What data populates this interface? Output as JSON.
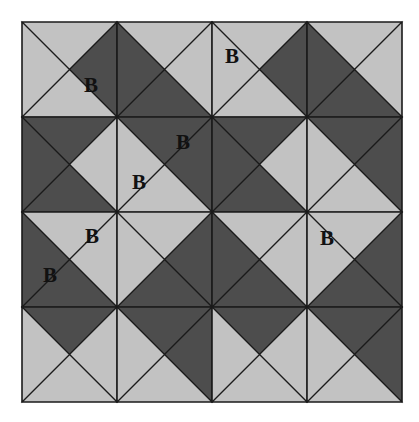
{
  "figure": {
    "background_color": "#ffffff"
  },
  "palette": {
    "light": "#c2c2c2",
    "dark": "#4d4d4d",
    "outline": "#1a1a1a",
    "label_color": "#111111"
  },
  "geometry": {
    "origin_x": 22,
    "origin_y": 22,
    "cell_size": 95,
    "columns": 4,
    "rows": 4,
    "column_edges": [
      22,
      117,
      212,
      307,
      402
    ],
    "row_edges": [
      22,
      117,
      212,
      307,
      402
    ]
  },
  "chart_data": {
    "type": "heatmap",
    "xlabel": "",
    "ylabel": "",
    "categories": [
      "col-1",
      "col-2",
      "col-3",
      "col-4"
    ],
    "row_labels": [
      "row-1",
      "row-2",
      "row-3",
      "row-4"
    ],
    "shade_legend": [
      {
        "name": "light",
        "color": "#c2c2c2"
      },
      {
        "name": "dark",
        "color": "#4d4d4d"
      }
    ],
    "triangle_order": [
      "top",
      "right",
      "bottom",
      "left"
    ],
    "cells": [
      {
        "row": 1,
        "col": 1,
        "top": "light",
        "right": "dark",
        "bottom": "light",
        "left": "light"
      },
      {
        "row": 1,
        "col": 2,
        "top": "light",
        "right": "light",
        "bottom": "dark",
        "left": "dark"
      },
      {
        "row": 1,
        "col": 3,
        "top": "light",
        "right": "dark",
        "bottom": "light",
        "left": "light"
      },
      {
        "row": 1,
        "col": 4,
        "top": "light",
        "right": "light",
        "bottom": "dark",
        "left": "dark"
      },
      {
        "row": 2,
        "col": 1,
        "top": "dark",
        "right": "light",
        "bottom": "dark",
        "left": "dark"
      },
      {
        "row": 2,
        "col": 2,
        "top": "dark",
        "right": "dark",
        "bottom": "light",
        "left": "light"
      },
      {
        "row": 2,
        "col": 3,
        "top": "dark",
        "right": "light",
        "bottom": "dark",
        "left": "dark"
      },
      {
        "row": 2,
        "col": 4,
        "top": "dark",
        "right": "dark",
        "bottom": "light",
        "left": "light"
      },
      {
        "row": 3,
        "col": 1,
        "top": "light",
        "right": "light",
        "bottom": "dark",
        "left": "dark"
      },
      {
        "row": 3,
        "col": 2,
        "top": "light",
        "right": "dark",
        "bottom": "dark",
        "left": "light"
      },
      {
        "row": 3,
        "col": 3,
        "top": "light",
        "right": "light",
        "bottom": "dark",
        "left": "dark"
      },
      {
        "row": 3,
        "col": 4,
        "top": "light",
        "right": "dark",
        "bottom": "dark",
        "left": "light"
      },
      {
        "row": 4,
        "col": 1,
        "top": "dark",
        "right": "light",
        "bottom": "light",
        "left": "light"
      },
      {
        "row": 4,
        "col": 2,
        "top": "dark",
        "right": "dark",
        "bottom": "light",
        "left": "light"
      },
      {
        "row": 4,
        "col": 3,
        "top": "dark",
        "right": "light",
        "bottom": "light",
        "left": "light"
      },
      {
        "row": 4,
        "col": 4,
        "top": "dark",
        "right": "dark",
        "bottom": "light",
        "left": "light"
      }
    ],
    "annotations": [
      {
        "text": "B",
        "x": 91,
        "y": 87,
        "on_shade": "dark",
        "cell": "row-1 col-1 right"
      },
      {
        "text": "B",
        "x": 232,
        "y": 58,
        "on_shade": "light",
        "cell": "row-1 col-3 left"
      },
      {
        "text": "B",
        "x": 183,
        "y": 144,
        "on_shade": "dark",
        "cell": "row-2 col-2 top"
      },
      {
        "text": "B",
        "x": 139,
        "y": 184,
        "on_shade": "light",
        "cell": "row-2 col-2 bottom"
      },
      {
        "text": "B",
        "x": 92,
        "y": 238,
        "on_shade": "light",
        "cell": "row-3 col-1 top"
      },
      {
        "text": "B",
        "x": 50,
        "y": 277,
        "on_shade": "dark",
        "cell": "row-3 col-1 left"
      },
      {
        "text": "B",
        "x": 327,
        "y": 240,
        "on_shade": "light",
        "cell": "row-3 col-4 top"
      }
    ]
  }
}
